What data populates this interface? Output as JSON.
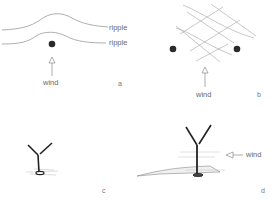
{
  "figure": {
    "panels": [
      {
        "id": "a",
        "label": "a",
        "labels": [
          "ripple",
          "ripple",
          "wind"
        ]
      },
      {
        "id": "b",
        "label": "b",
        "labels": [
          "wind"
        ]
      },
      {
        "id": "c",
        "label": "c",
        "labels": []
      },
      {
        "id": "d",
        "label": "d",
        "labels": [
          "wind"
        ]
      }
    ]
  },
  "colors": {
    "line": "#9a9a9a",
    "dot": "#2a2a2a",
    "stem": "#222222"
  }
}
